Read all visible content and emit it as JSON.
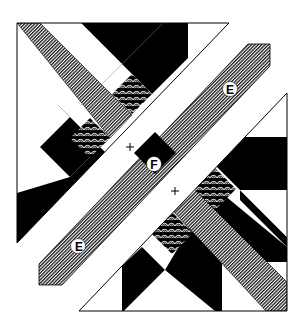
{
  "diagram": {
    "colors": {
      "background": "#ffffff",
      "solid": "#000000",
      "stripe_dark": "#1a1a1a",
      "stripe_light": "#ffffff",
      "outline": "#000000"
    },
    "labels": {
      "strip_upper": "E",
      "strip_lower": "E",
      "center_square": "F"
    },
    "markers": {
      "upper_cross": "+",
      "lower_cross": "+"
    },
    "sections": [
      {
        "name": "upper-left-triangle",
        "description": "Half-square block with star points, striped sash, and patterned diamonds"
      },
      {
        "name": "center-strip",
        "description": "Diagonal striped sashing strip labeled E with black center square F"
      },
      {
        "name": "lower-right-triangle",
        "description": "Half-square block with star points, striped sash, and patterned diamonds"
      }
    ]
  }
}
